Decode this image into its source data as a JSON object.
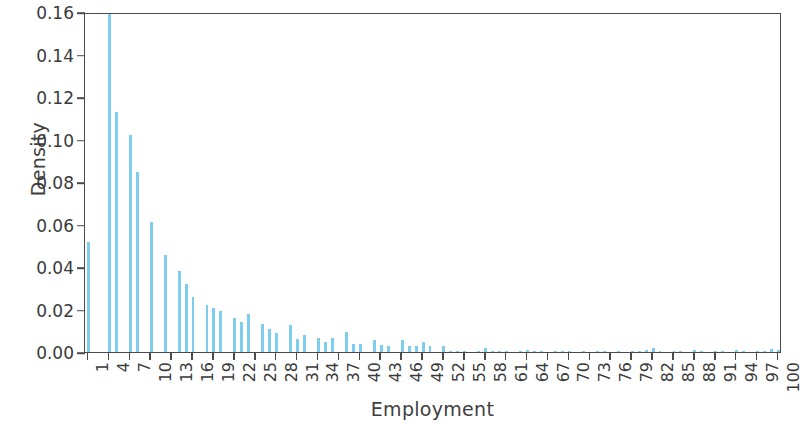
{
  "chart_data": {
    "type": "bar",
    "title": "",
    "subtitle": "",
    "xlabel": "Employment",
    "ylabel": "Density",
    "xlim": [
      0.5,
      100.5
    ],
    "ylim": [
      0.0,
      0.16
    ],
    "grid": false,
    "legend": null,
    "bar_color": "#7ecdee",
    "axis_color": "#4a4a4a",
    "ytick_labels": [
      "0.00",
      "0.02",
      "0.04",
      "0.06",
      "0.08",
      "0.10",
      "0.12",
      "0.14",
      "0.16"
    ],
    "ytick_values": [
      0.0,
      0.02,
      0.04,
      0.06,
      0.08,
      0.1,
      0.12,
      0.14,
      0.16
    ],
    "xtick_labels": [
      "1",
      "4",
      "7",
      "10",
      "13",
      "16",
      "19",
      "22",
      "25",
      "28",
      "31",
      "34",
      "37",
      "40",
      "43",
      "46",
      "49",
      "52",
      "55",
      "58",
      "61",
      "64",
      "67",
      "70",
      "73",
      "76",
      "79",
      "82",
      "85",
      "88",
      "91",
      "94",
      "97",
      "100"
    ],
    "xtick_values": [
      1,
      4,
      7,
      10,
      13,
      16,
      19,
      22,
      25,
      28,
      31,
      34,
      37,
      40,
      43,
      46,
      49,
      52,
      55,
      58,
      61,
      64,
      67,
      70,
      73,
      76,
      79,
      82,
      85,
      88,
      91,
      94,
      97,
      100
    ],
    "categories": [
      1,
      2,
      3,
      4,
      5,
      6,
      7,
      8,
      9,
      10,
      11,
      12,
      13,
      14,
      15,
      16,
      17,
      18,
      19,
      20,
      21,
      22,
      23,
      24,
      25,
      26,
      27,
      28,
      29,
      30,
      31,
      32,
      33,
      34,
      35,
      36,
      37,
      38,
      39,
      40,
      41,
      42,
      43,
      44,
      45,
      46,
      47,
      48,
      49,
      50,
      51,
      52,
      53,
      54,
      55,
      56,
      57,
      58,
      59,
      60,
      61,
      62,
      63,
      64,
      65,
      66,
      67,
      68,
      69,
      70,
      71,
      72,
      73,
      74,
      75,
      76,
      77,
      78,
      79,
      80,
      81,
      82,
      83,
      84,
      85,
      86,
      87,
      88,
      89,
      90,
      91,
      92,
      93,
      94,
      95,
      96,
      97,
      98,
      99,
      100
    ],
    "values": [
      0.052,
      0.0,
      0.0,
      0.16,
      0.113,
      0.0,
      0.102,
      0.0845,
      0.0,
      0.061,
      0.0,
      0.0455,
      0.0,
      0.0383,
      0.032,
      0.026,
      0.0,
      0.0222,
      0.0205,
      0.0195,
      0.0,
      0.016,
      0.014,
      0.0178,
      0.0,
      0.013,
      0.0106,
      0.0088,
      0.0,
      0.0125,
      0.006,
      0.008,
      0.0,
      0.0068,
      0.0046,
      0.0064,
      0.0,
      0.0092,
      0.004,
      0.0038,
      0.0,
      0.0058,
      0.0032,
      0.003,
      0.0,
      0.0056,
      0.003,
      0.0028,
      0.0048,
      0.0026,
      0.0,
      0.003,
      0.0004,
      0.0003,
      0.0005,
      0.0,
      0.0006,
      0.002,
      0.0004,
      0.0003,
      0.0005,
      0.0,
      0.0004,
      0.0008,
      0.0003,
      0.0005,
      0.0,
      0.0004,
      0.0006,
      0.0003,
      0.0002,
      0.0005,
      0.0,
      0.0003,
      0.0004,
      0.0002,
      0.0006,
      0.0,
      0.0003,
      0.0004,
      0.001,
      0.0018,
      0.0003,
      0.0,
      0.0004,
      0.0005,
      0.0002,
      0.0008,
      0.0003,
      0.0,
      0.0004,
      0.0006,
      0.0002,
      0.001,
      0.0003,
      0.0,
      0.0004,
      0.0005,
      0.0012,
      0.0008
    ]
  }
}
